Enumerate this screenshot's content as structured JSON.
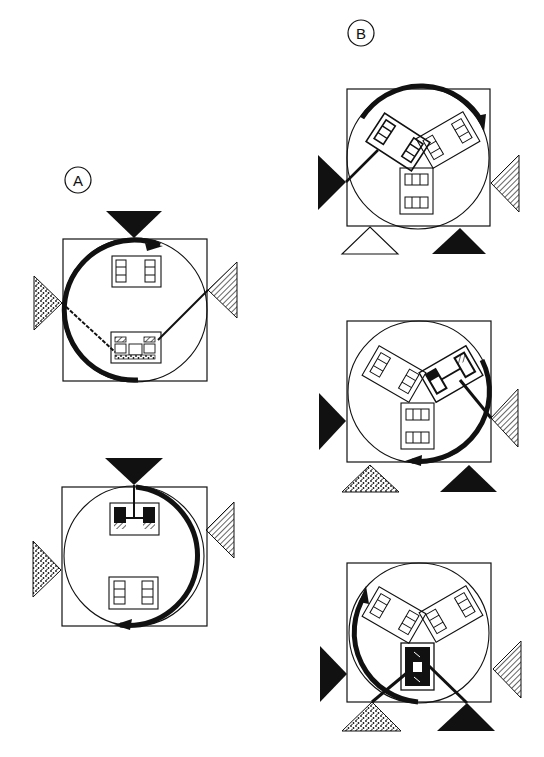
{
  "labels": {
    "group_a": "A",
    "group_b": "B"
  },
  "colors": {
    "ink": "#111111",
    "paper": "#ffffff"
  },
  "panels": [
    {
      "id": "A1",
      "group": "A",
      "description": "Square chamber with circular path; two wafer holders (top, bottom); black source at top, dotted source at left, hatched source at right; arc arrow along left side; lines from left/right sources to bottom holder"
    },
    {
      "id": "A2",
      "group": "A",
      "description": "Square chamber; holder at top connected to black top source; lower holder; dotted source left, hatched source right; arc arrow along right side pointing to bottom"
    },
    {
      "id": "B1",
      "group": "B",
      "description": "Square chamber with three holders (two tilted, one vertical); black source left connected to top-left holder; hatched source right; open triangle bottom-left; black triangle bottom-right; arc arrow across top"
    },
    {
      "id": "B2",
      "group": "B",
      "description": "Three holders; top-right holder connected to hatched right source; black left source; dotted bottom-left triangle; black bottom-right triangle; arc arrow on right side to bottom"
    },
    {
      "id": "B3",
      "group": "B",
      "description": "Three holders; bottom holder connected to dotted bottom-left and black bottom-right triangles; black left source; hatched right source; arc arrow on left side pointing up"
    }
  ]
}
